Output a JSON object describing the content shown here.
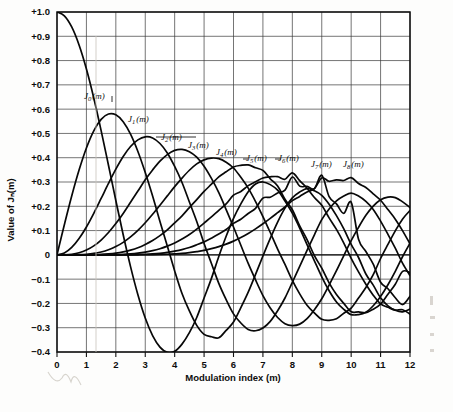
{
  "figure": {
    "kind": "bessel-function-chart",
    "background_color": "#fdfdfc",
    "ink_color": "#0d0d0d",
    "grid_color": "#3a3a3a"
  },
  "axes": {
    "x_title": "Modulation index (m)",
    "y_title": "Value of Jₙ(m)",
    "x_ticks": [
      "0",
      "1",
      "2",
      "3",
      "4",
      "5",
      "6",
      "7",
      "8",
      "9",
      "10",
      "11",
      "12"
    ],
    "y_ticks": [
      "+1.0",
      "+0.9",
      "+0.8",
      "+0.7",
      "+0.6",
      "+0.5",
      "+0.4",
      "+0.3",
      "+0.2",
      "+0.1",
      "0",
      "−0.1",
      "−0.2",
      "−0.3",
      "−0.4"
    ]
  },
  "curve_labels": [
    {
      "base": "J",
      "sub": "0",
      "arg": "(m)"
    },
    {
      "base": "J",
      "sub": "1",
      "arg": "(m)"
    },
    {
      "base": "J",
      "sub": "2",
      "arg": "(m)"
    },
    {
      "base": "J",
      "sub": "3",
      "arg": "(m)"
    },
    {
      "base": "J",
      "sub": "4",
      "arg": "(m)"
    },
    {
      "base": "J",
      "sub": "5",
      "arg": "(m)"
    },
    {
      "base": "J",
      "sub": "6",
      "arg": "(m)"
    },
    {
      "base": "J",
      "sub": "7",
      "arg": "(m)"
    },
    {
      "base": "J",
      "sub": "8",
      "arg": "(m)"
    }
  ],
  "chart_data": {
    "type": "line",
    "title": "",
    "subtitle": "",
    "xlabel": "Modulation index (m)",
    "ylabel": "Value of Jₙ(m)",
    "xlim": [
      0,
      12
    ],
    "ylim": [
      -0.4,
      1.0
    ],
    "xtick_step": 1,
    "ytick_step": 0.1,
    "grid": true,
    "legend": "inline-labels",
    "x": [
      0,
      0.25,
      0.5,
      0.75,
      1,
      1.25,
      1.5,
      1.75,
      2,
      2.25,
      2.5,
      2.75,
      3,
      3.25,
      3.5,
      3.75,
      4,
      4.25,
      4.5,
      4.75,
      5,
      5.25,
      5.5,
      5.75,
      6,
      6.25,
      6.5,
      6.75,
      7,
      7.25,
      7.5,
      7.75,
      8,
      8.25,
      8.5,
      8.75,
      9,
      9.25,
      9.5,
      9.75,
      10,
      10.25,
      10.5,
      10.75,
      11,
      11.25,
      11.5,
      11.75,
      12
    ],
    "series": [
      {
        "name": "J0(m)",
        "label": "J₀(m)",
        "values": [
          1.0,
          0.9844,
          0.9385,
          0.8642,
          0.7652,
          0.6459,
          0.5118,
          0.369,
          0.2239,
          0.0827,
          -0.0484,
          -0.1641,
          -0.2601,
          -0.3325,
          -0.3801,
          -0.4018,
          -0.3971,
          -0.3675,
          -0.3205,
          -0.2578,
          -0.1776,
          -0.0968,
          -0.0068,
          0.0766,
          0.1506,
          0.2099,
          0.2601,
          0.2921,
          0.3001,
          0.2892,
          0.2663,
          0.2218,
          0.1717,
          0.1103,
          0.0419,
          -0.0246,
          -0.0903,
          -0.1476,
          -0.1939,
          -0.2243,
          -0.2459,
          -0.2459,
          -0.2366,
          -0.2097,
          -0.1712,
          -0.123,
          -0.0677,
          -0.0068,
          0.0477
        ]
      },
      {
        "name": "J1(m)",
        "label": "J₁(m)",
        "values": [
          0.0,
          0.124,
          0.2423,
          0.3492,
          0.4401,
          0.5106,
          0.5579,
          0.5802,
          0.5767,
          0.5484,
          0.4971,
          0.4258,
          0.3391,
          0.2422,
          0.1374,
          0.0365,
          -0.066,
          -0.1593,
          -0.2311,
          -0.2905,
          -0.3276,
          -0.3371,
          -0.3414,
          -0.311,
          -0.2767,
          -0.2175,
          -0.1538,
          -0.0805,
          -0.0047,
          0.0679,
          0.1352,
          0.1923,
          0.2346,
          0.2589,
          0.2731,
          0.2639,
          0.2453,
          0.2087,
          0.1613,
          0.1068,
          0.0435,
          -0.0109,
          -0.0789,
          -0.1247,
          -0.1768,
          -0.21,
          -0.2284,
          -0.235,
          -0.2234
        ]
      },
      {
        "name": "J2(m)",
        "label": "J₂(m)",
        "values": [
          0.0,
          0.0078,
          0.0306,
          0.0673,
          0.1149,
          0.1711,
          0.2321,
          0.294,
          0.3528,
          0.405,
          0.4461,
          0.4735,
          0.4861,
          0.4813,
          0.4586,
          0.4196,
          0.3641,
          0.298,
          0.2178,
          0.1373,
          0.0466,
          -0.0354,
          -0.1173,
          -0.1843,
          -0.2429,
          -0.2807,
          -0.3074,
          -0.3125,
          -0.3014,
          -0.274,
          -0.2303,
          -0.1777,
          -0.113,
          -0.0475,
          0.0184,
          0.0827,
          0.1448,
          0.1887,
          0.2223,
          0.2421,
          0.2546,
          0.242,
          0.2199,
          0.1871,
          0.139,
          0.0847,
          0.0276,
          -0.0351,
          -0.0849
        ]
      },
      {
        "name": "J3(m)",
        "label": "J₃(m)",
        "values": [
          0.0,
          0.0003,
          0.0026,
          0.0085,
          0.0196,
          0.0369,
          0.061,
          0.092,
          0.1289,
          0.1707,
          0.2166,
          0.2626,
          0.3091,
          0.3496,
          0.3856,
          0.413,
          0.4302,
          0.4343,
          0.4247,
          0.4022,
          0.3648,
          0.3147,
          0.2561,
          0.1866,
          0.1148,
          0.0395,
          -0.0353,
          -0.1034,
          -0.1676,
          -0.2185,
          -0.2581,
          -0.2833,
          -0.2911,
          -0.2852,
          -0.2626,
          -0.2259,
          -0.1809,
          -0.1243,
          -0.0653,
          -0.0027,
          0.0583,
          0.1132,
          0.1628,
          0.2008,
          0.2273,
          0.2379,
          0.2357,
          0.2182,
          0.1951
        ]
      },
      {
        "name": "J4(m)",
        "label": "J₄(m)",
        "values": [
          0.0,
          1e-05,
          0.0002,
          0.0008,
          0.0025,
          0.0058,
          0.0118,
          0.0209,
          0.034,
          0.0515,
          0.0738,
          0.1007,
          0.132,
          0.167,
          0.2044,
          0.2429,
          0.2811,
          0.3162,
          0.3484,
          0.3746,
          0.3912,
          0.3985,
          0.396,
          0.3811,
          0.3576,
          0.3191,
          0.2748,
          0.2196,
          0.1578,
          0.092,
          0.0238,
          -0.0396,
          -0.1054,
          -0.1608,
          -0.2077,
          -0.2392,
          -0.2655,
          -0.2695,
          -0.2632,
          -0.2404,
          -0.2196,
          -0.178,
          -0.1345,
          -0.0816,
          -0.015,
          0.043,
          0.0989,
          0.1481,
          0.1825
        ]
      },
      {
        "name": "J5(m)",
        "label": "J₅(m)",
        "values": [
          0.0,
          0.0,
          1e-05,
          6e-05,
          0.0002,
          0.0007,
          0.0018,
          0.0038,
          0.007,
          0.0121,
          0.0195,
          0.0294,
          0.043,
          0.0592,
          0.0792,
          0.1029,
          0.1321,
          0.1607,
          0.1947,
          0.2277,
          0.2611,
          0.2909,
          0.3209,
          0.3419,
          0.3621,
          0.3686,
          0.3704,
          0.3586,
          0.3479,
          0.3131,
          0.2835,
          0.2293,
          0.1858,
          0.1197,
          0.0631,
          -0.0034,
          -0.055,
          -0.115,
          -0.1631,
          -0.1998,
          -0.2341,
          -0.2347,
          -0.238,
          -0.2236,
          -0.2028,
          -0.1623,
          -0.1209,
          -0.0677,
          -0.0735
        ]
      },
      {
        "name": "J6(m)",
        "label": "J₆(m)",
        "values": [
          0.0,
          0.0,
          0.0,
          3e-06,
          2e-05,
          7e-05,
          0.0002,
          0.0006,
          0.0012,
          0.0024,
          0.0042,
          0.0071,
          0.0114,
          0.0173,
          0.0254,
          0.036,
          0.0491,
          0.0656,
          0.0837,
          0.1061,
          0.131,
          0.1561,
          0.1833,
          0.2096,
          0.2458,
          0.261,
          0.2851,
          0.301,
          0.3165,
          0.3214,
          0.322,
          0.3114,
          0.3376,
          0.3055,
          0.2744,
          0.2363,
          0.2043,
          0.1523,
          0.1047,
          0.0488,
          -0.0145,
          -0.0703,
          -0.121,
          -0.1661,
          -0.2016,
          -0.2158,
          -0.2276,
          -0.226,
          -0.2437
        ]
      },
      {
        "name": "J7(m)",
        "label": "J₇(m)",
        "values": [
          0.0,
          0.0,
          0.0,
          0.0,
          2e-06,
          1e-05,
          2e-05,
          8e-05,
          0.0002,
          0.0004,
          0.0008,
          0.0015,
          0.0025,
          0.0041,
          0.0065,
          0.0099,
          0.0152,
          0.0217,
          0.0303,
          0.0413,
          0.0534,
          0.0687,
          0.0855,
          0.1046,
          0.1296,
          0.1467,
          0.1703,
          0.1917,
          0.2336,
          0.2375,
          0.2546,
          0.2668,
          0.3206,
          0.283,
          0.2821,
          0.2728,
          0.3275,
          0.2399,
          0.2099,
          0.1709,
          0.2167,
          0.0643,
          0.0139,
          -0.0386,
          -0.113,
          -0.1397,
          -0.1768,
          -0.2045,
          -0.1703
        ]
      },
      {
        "name": "J8(m)",
        "label": "J₈(m)",
        "values": [
          0.0,
          0.0,
          0.0,
          0.0,
          0.0,
          2e-06,
          6e-06,
          2e-05,
          2e-05,
          6e-05,
          0.0001,
          0.0003,
          0.0005,
          0.0009,
          0.0015,
          0.0024,
          0.004,
          0.006,
          0.0091,
          0.0133,
          0.0184,
          0.0254,
          0.0337,
          0.044,
          0.0565,
          0.071,
          0.0879,
          0.1069,
          0.128,
          0.1504,
          0.1737,
          0.1972,
          0.2235,
          0.2407,
          0.2592,
          0.2726,
          0.3169,
          0.3031,
          0.3089,
          0.3063,
          0.3179,
          0.2935,
          0.2776,
          0.2514,
          0.225,
          0.1866,
          0.1469,
          0.0989,
          0.0451
        ]
      }
    ],
    "notable_points": {
      "J0_max": {
        "x": 0,
        "y": 1.0
      },
      "J0_min": {
        "x": 3.83,
        "y": -0.403
      },
      "J1_max": {
        "x": 1.84,
        "y": 0.582
      },
      "J2_max": {
        "x": 3.05,
        "y": 0.486
      },
      "J3_max": {
        "x": 4.2,
        "y": 0.434
      },
      "J4_max": {
        "x": 5.3,
        "y": 0.399
      },
      "J5_max": {
        "x": 6.4,
        "y": 0.373
      },
      "J6_max": {
        "x": 7.5,
        "y": 0.35
      },
      "J7_max": {
        "x": 8.6,
        "y": 0.333
      },
      "J8_max": {
        "x": 9.7,
        "y": 0.318
      }
    }
  }
}
